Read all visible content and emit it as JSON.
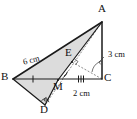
{
  "figure": {
    "kind": "geometry-diagram",
    "background": "#ffffff",
    "fill_color": "#dcdcdc",
    "stroke_color": "#1a1a1a",
    "dash_color": "#555555"
  },
  "points": [
    {
      "id": "A",
      "label": "A",
      "x": 102,
      "y": 22,
      "label_x": 99,
      "label_y": 5
    },
    {
      "id": "B",
      "label": "B",
      "x": 13,
      "y": 79,
      "label_x": 2,
      "label_y": 72
    },
    {
      "id": "C",
      "label": "C",
      "x": 102,
      "y": 79,
      "label_x": 105,
      "label_y": 73
    },
    {
      "id": "D",
      "label": "D",
      "x": 45,
      "y": 105,
      "label_x": 41,
      "label_y": 106
    },
    {
      "id": "E",
      "label": "E",
      "x": 72,
      "y": 62,
      "label_x": 65,
      "label_y": 48
    },
    {
      "id": "M",
      "label": "M",
      "x": 58,
      "y": 80,
      "label_x": 55,
      "label_y": 84
    }
  ],
  "segments": [
    {
      "name": "AB",
      "from": "A",
      "to": "B",
      "style": "solid"
    },
    {
      "name": "AC",
      "from": "A",
      "to": "C",
      "style": "solid"
    },
    {
      "name": "BC",
      "from": "B",
      "to": "C",
      "style": "solid"
    },
    {
      "name": "AM",
      "from": "A",
      "to": "M",
      "style": "solid"
    },
    {
      "name": "MD",
      "from": "M",
      "to": "D",
      "style": "solid"
    },
    {
      "name": "BD",
      "from": "B",
      "to": "D",
      "style": "solid"
    },
    {
      "name": "EC",
      "from": "E",
      "to": "C",
      "style": "dashed"
    },
    {
      "name": "AE-extension",
      "from": "A",
      "to": "D",
      "style": "dashed"
    }
  ],
  "filled_regions": [
    {
      "name": "triangle-ABM",
      "points": "A,B,M"
    },
    {
      "name": "triangle-BMD",
      "points": "B,M,D"
    }
  ],
  "dimensions": [
    {
      "name": "BE-length",
      "text": "6 cm",
      "x": 21,
      "y": 60,
      "rotate": -14
    },
    {
      "name": "AC-length",
      "text": "3 cm",
      "x": 110,
      "y": 52,
      "rotate": 0
    },
    {
      "name": "MC-length",
      "text": "2 cm",
      "x": 74,
      "y": 90,
      "rotate": 0
    }
  ],
  "tick_marks": [
    {
      "name": "tick-BM",
      "count": 1,
      "x": 33,
      "y": 79
    },
    {
      "name": "tick-MC",
      "count": 3,
      "x": 81,
      "y": 79
    }
  ],
  "angle_marks": [
    {
      "name": "right-angle-at-D",
      "type": "right",
      "x": 45,
      "y": 105
    },
    {
      "name": "right-angle-at-E",
      "type": "right",
      "x": 72,
      "y": 62
    },
    {
      "name": "arc-at-M",
      "type": "arc",
      "x": 58,
      "y": 80
    },
    {
      "name": "arc-at-C",
      "type": "arc",
      "x": 102,
      "y": 79
    }
  ]
}
